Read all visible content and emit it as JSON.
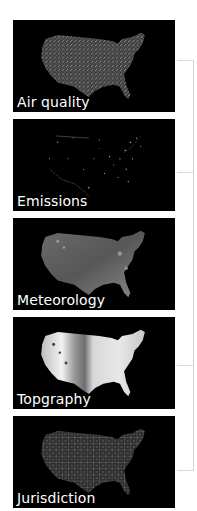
{
  "figure": {
    "panels": [
      {
        "label": "Air quality",
        "map_style": "dense-speckle"
      },
      {
        "label": "Emissions",
        "map_style": "sparse-points"
      },
      {
        "label": "Meteorology",
        "map_style": "gray-field"
      },
      {
        "label": "Topgraphy",
        "map_style": "elevation-bright"
      },
      {
        "label": "Jurisdiction",
        "map_style": "boundary-lines"
      }
    ],
    "colors": {
      "panel_background": "#000000",
      "label_text": "#ffffff",
      "bracket_line": "#d4d4d4",
      "page_background": "#ffffff"
    }
  }
}
